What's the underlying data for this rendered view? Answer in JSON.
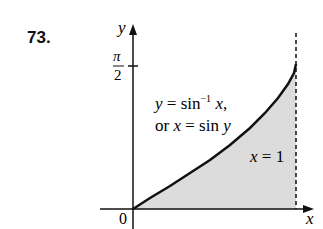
{
  "problem_number": "73.",
  "axes": {
    "x_label": "x",
    "y_label": "y",
    "origin_label": "0"
  },
  "y_tick": {
    "numerator": "π",
    "denominator": "2"
  },
  "curve_label": {
    "line1_pre": "y = sin",
    "line1_exp": "−1",
    "line1_post": " x,",
    "line2": "or x = sin y"
  },
  "boundary_label": "x = 1",
  "colors": {
    "shade": "#dcdcdc",
    "ink": "#111111"
  }
}
